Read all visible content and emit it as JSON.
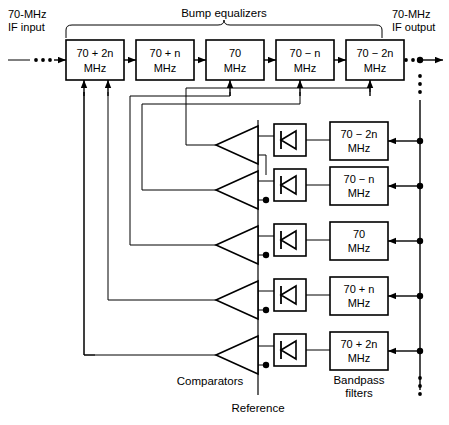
{
  "diagram": {
    "title_brace": "Bump equalizers",
    "input_label_line1": "70-MHz",
    "input_label_line2": "IF input",
    "output_label_line1": "70-MHz",
    "output_label_line2": "IF output",
    "comparators_label": "Comparators",
    "reference_label": "Reference",
    "bandpass_label_line1": "Bandpass",
    "bandpass_label_line2": "filters",
    "units": "MHz",
    "line_color": "#000000",
    "bg_color": "#ffffff"
  },
  "equalizers": [
    {
      "freq": "70 + 2n",
      "units": "MHz"
    },
    {
      "freq": "70 + n",
      "units": "MHz"
    },
    {
      "freq": "70",
      "units": "MHz"
    },
    {
      "freq": "70 − n",
      "units": "MHz"
    },
    {
      "freq": "70 − 2n",
      "units": "MHz"
    }
  ],
  "filters": [
    {
      "freq": "70 − 2n",
      "units": "MHz"
    },
    {
      "freq": "70 − n",
      "units": "MHz"
    },
    {
      "freq": "70",
      "units": "MHz"
    },
    {
      "freq": "70 + n",
      "units": "MHz"
    },
    {
      "freq": "70 + 2n",
      "units": "MHz"
    }
  ],
  "comparator_count": 5,
  "diode_count": 5
}
